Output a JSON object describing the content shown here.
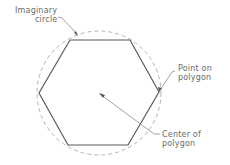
{
  "diagram": {
    "type": "inscribed-polygon",
    "labels": {
      "imaginary_circle_line1": "Imaginary",
      "imaginary_circle_line2": "circle",
      "point_on_polygon_line1": "Point on",
      "point_on_polygon_line2": "polygon",
      "center_line1": "Center of",
      "center_line2": "polygon"
    },
    "colors": {
      "polygon_stroke": "#5a5a5a",
      "circle_stroke": "#9a9a9a",
      "leader_stroke": "#7a7a7a",
      "text": "#6a6a6a"
    }
  }
}
